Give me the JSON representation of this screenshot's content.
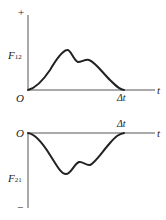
{
  "diagrams": [
    {
      "id": "top",
      "y_label": "F",
      "y_label_sub": "12",
      "sign_label": "+",
      "origin_label": "O",
      "x_axis_label": "t",
      "duration_label": "Δt"
    },
    {
      "id": "bottom",
      "y_label": "F",
      "y_label_sub": "21",
      "sign_label": "−",
      "origin_label": "O",
      "x_axis_label": "t",
      "duration_label": "Δt"
    }
  ],
  "colors": {
    "ink": "#222222",
    "axis": "#555555",
    "background": "#ffffff"
  }
}
